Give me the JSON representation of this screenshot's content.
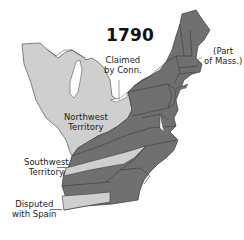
{
  "map": {
    "title": "1790",
    "colors": {
      "states": "#707070",
      "territories": "#cfcfcf",
      "borders": "#3a3a3a",
      "water": "#ffffff",
      "background": "#ffffff"
    },
    "labels": {
      "claimed_by_conn": [
        "Claimed",
        "by Conn."
      ],
      "part_of_mass": [
        "(Part",
        "of Mass.)"
      ],
      "northwest_territory": [
        "Northwest",
        "Territory"
      ],
      "southwest_territory": [
        "Southwest",
        "Territory"
      ],
      "disputed_with_spain": [
        "Disputed",
        "with Spain"
      ]
    },
    "legend": {
      "states": "States (dark gray)",
      "territories": "Territories / claimed lands (light gray)"
    }
  }
}
